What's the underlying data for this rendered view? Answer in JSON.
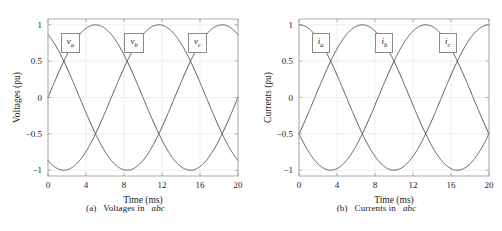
{
  "figure": {
    "title": "",
    "background_color": "#ffffff",
    "axis_color": "#9a9a9a",
    "grid_color": "#e4e4e4",
    "curve_color": "#4a4a4a"
  },
  "chart_data": [
    {
      "type": "line",
      "panel_id": "a",
      "title": "",
      "caption_prefix": "(a)",
      "caption_text": "Voltages in",
      "caption_italic": "abc",
      "xlabel": "Time (ms)",
      "ylabel": "Voltages (pu)",
      "xlim": [
        0,
        20
      ],
      "ylim": [
        -1.08,
        1.08
      ],
      "xticks": [
        0,
        4,
        8,
        12,
        16,
        20
      ],
      "xtick_labels": [
        "0",
        "4",
        "8",
        "12",
        "16",
        "20"
      ],
      "yticks": [
        -1,
        -0.5,
        0,
        0.5,
        1
      ],
      "ytick_labels": [
        "-1",
        "-0.5",
        "0",
        "0.5",
        "1"
      ],
      "grid": true,
      "legend": "inline-boxed-labels",
      "period_ms": 20,
      "amplitude_pu": 1,
      "series": [
        {
          "name": "v_a",
          "label_base": "v",
          "label_sub": "a",
          "phase_deg": 0,
          "label_x_ms": 2.4,
          "label_y_pu": 0.78
        },
        {
          "name": "v_b",
          "label_base": "v",
          "label_sub": "b",
          "phase_deg": -120,
          "label_x_ms": 9.1,
          "label_y_pu": 0.78
        },
        {
          "name": "v_c",
          "label_base": "v",
          "label_sub": "c",
          "phase_deg": 120,
          "label_x_ms": 15.8,
          "label_y_pu": 0.78
        }
      ]
    },
    {
      "type": "line",
      "panel_id": "b",
      "title": "",
      "caption_prefix": "(b)",
      "caption_text": "Currents in",
      "caption_italic": "abc",
      "xlabel": "Time (ms)",
      "ylabel": "Currents (pu)",
      "xlim": [
        0,
        20
      ],
      "ylim": [
        -1.08,
        1.08
      ],
      "xticks": [
        0,
        4,
        8,
        12,
        16,
        20
      ],
      "xtick_labels": [
        "0",
        "4",
        "8",
        "12",
        "16",
        "20"
      ],
      "yticks": [
        -1,
        -0.5,
        0,
        0.5,
        1
      ],
      "ytick_labels": [
        "-1",
        "-0.5",
        "0",
        "0.5",
        "1"
      ],
      "grid": true,
      "legend": "inline-boxed-labels",
      "period_ms": 20,
      "amplitude_pu": 1,
      "series": [
        {
          "name": "i_a",
          "label_base": "i",
          "label_sub": "a",
          "phase_deg": 90,
          "label_x_ms": 2.4,
          "label_y_pu": 0.78
        },
        {
          "name": "i_b",
          "label_base": "i",
          "label_sub": "b",
          "phase_deg": -30,
          "label_x_ms": 9.1,
          "label_y_pu": 0.78
        },
        {
          "name": "i_c",
          "label_base": "i",
          "label_sub": "c",
          "phase_deg": -150,
          "label_x_ms": 15.8,
          "label_y_pu": 0.78
        }
      ]
    }
  ]
}
